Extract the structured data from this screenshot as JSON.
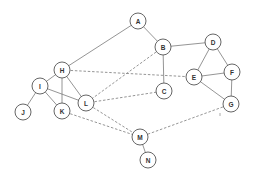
{
  "diagram": {
    "type": "undirected-graph",
    "node_radius": 8,
    "colors": {
      "node_stroke": "#555555",
      "edge": "#7a7a7a",
      "label": "#333333",
      "background": "#ffffff"
    },
    "nodes": [
      {
        "id": "A",
        "label": "A",
        "x": 138,
        "y": 21
      },
      {
        "id": "B",
        "label": "B",
        "x": 163,
        "y": 47
      },
      {
        "id": "C",
        "label": "C",
        "x": 164,
        "y": 91
      },
      {
        "id": "D",
        "label": "D",
        "x": 213,
        "y": 42
      },
      {
        "id": "E",
        "label": "E",
        "x": 194,
        "y": 77
      },
      {
        "id": "F",
        "label": "F",
        "x": 232,
        "y": 72
      },
      {
        "id": "G",
        "label": "G",
        "x": 231,
        "y": 104
      },
      {
        "id": "H",
        "label": "H",
        "x": 62,
        "y": 70
      },
      {
        "id": "I",
        "label": "I",
        "x": 40,
        "y": 86
      },
      {
        "id": "J",
        "label": "J",
        "x": 23,
        "y": 112
      },
      {
        "id": "K",
        "label": "K",
        "x": 62,
        "y": 111
      },
      {
        "id": "L",
        "label": "L",
        "x": 86,
        "y": 103
      },
      {
        "id": "M",
        "label": "M",
        "x": 140,
        "y": 137
      },
      {
        "id": "N",
        "label": "N",
        "x": 148,
        "y": 160
      }
    ],
    "edges": [
      {
        "from": "A",
        "to": "H",
        "style": "solid"
      },
      {
        "from": "A",
        "to": "B",
        "style": "solid"
      },
      {
        "from": "B",
        "to": "D",
        "style": "solid"
      },
      {
        "from": "B",
        "to": "C",
        "style": "solid"
      },
      {
        "from": "B",
        "to": "L",
        "style": "dashed"
      },
      {
        "from": "H",
        "to": "E",
        "style": "dashed"
      },
      {
        "from": "D",
        "to": "E",
        "style": "solid"
      },
      {
        "from": "D",
        "to": "F",
        "style": "solid"
      },
      {
        "from": "E",
        "to": "F",
        "style": "solid"
      },
      {
        "from": "E",
        "to": "G",
        "style": "solid"
      },
      {
        "from": "F",
        "to": "G",
        "style": "solid"
      },
      {
        "from": "G",
        "to": "M",
        "style": "dashed"
      },
      {
        "from": "H",
        "to": "I",
        "style": "solid"
      },
      {
        "from": "H",
        "to": "K",
        "style": "solid"
      },
      {
        "from": "H",
        "to": "L",
        "style": "solid"
      },
      {
        "from": "I",
        "to": "J",
        "style": "solid"
      },
      {
        "from": "I",
        "to": "K",
        "style": "solid"
      },
      {
        "from": "I",
        "to": "L",
        "style": "solid"
      },
      {
        "from": "L",
        "to": "C",
        "style": "dashed"
      },
      {
        "from": "L",
        "to": "M",
        "style": "dashed"
      },
      {
        "from": "K",
        "to": "M",
        "style": "dashed"
      },
      {
        "from": "M",
        "to": "N",
        "style": "solid"
      }
    ]
  }
}
